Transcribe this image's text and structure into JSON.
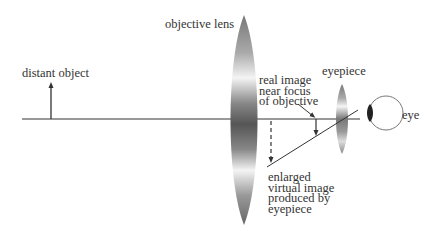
{
  "diagram": {
    "labels": {
      "distant_object": "distant object",
      "objective_lens": "objective lens",
      "real_image": [
        "real image",
        "near focus",
        "of objective"
      ],
      "eyepiece": "eyepiece",
      "eye": "eye",
      "virtual_image": [
        "enlarged",
        "virtual image",
        "produced by",
        "eyepiece"
      ]
    },
    "colors": {
      "line": "#333333",
      "text": "#333333",
      "lens_dark": "#555555",
      "lens_light": "#f2f2f2",
      "eye_outline": "#666666",
      "pupil": "#222222"
    },
    "elements": [
      "optical-axis",
      "object-arrow",
      "objective-lens",
      "real-image-arrow",
      "virtual-image-dashed-arrow",
      "eyepiece-lens",
      "eye",
      "sight-line"
    ]
  }
}
